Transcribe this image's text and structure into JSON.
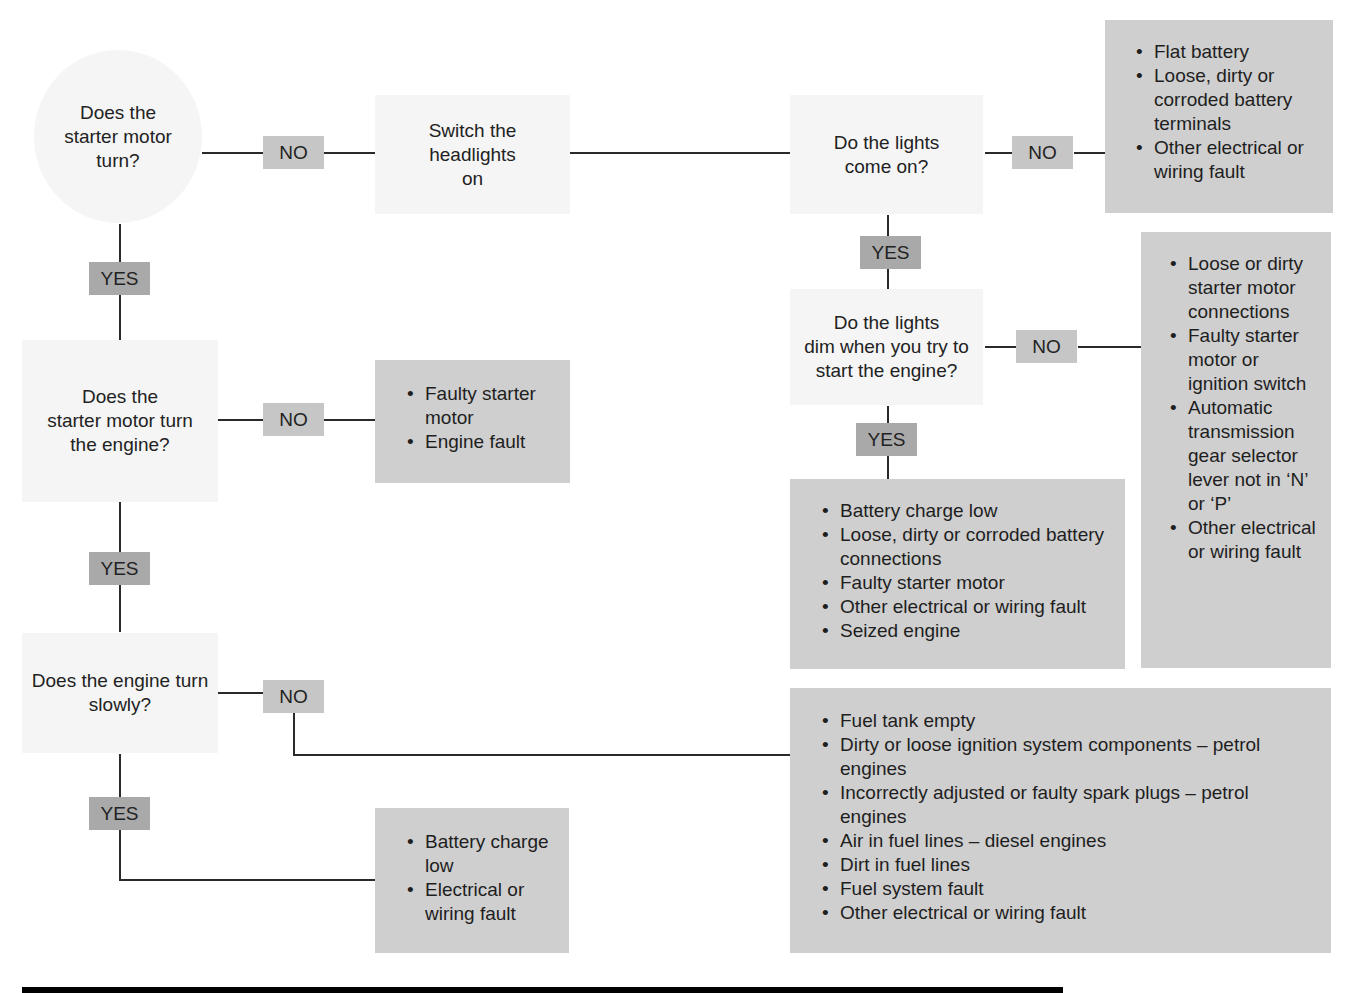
{
  "diagram": {
    "type": "troubleshooting-flowchart",
    "topic": "Engine will not start",
    "colors": {
      "question_bg": "#f5f5f5",
      "answer_bg": "#cfcfcf",
      "no_badge": "#c6c6c6",
      "yes_badge": "#a9a9a9",
      "connector": "#2a2a2a",
      "footer_bar": "#000000"
    },
    "labels": {
      "no": "NO",
      "yes": "YES"
    },
    "questions": {
      "q1": [
        "Does the",
        "starter motor",
        "turn?"
      ],
      "q2": [
        "Does the",
        "starter motor turn",
        "the engine?"
      ],
      "q3": [
        "Does the engine turn",
        "slowly?"
      ],
      "step_headlights": [
        "Switch the",
        "headlights",
        "on"
      ],
      "q4": [
        "Do the lights",
        "come on?"
      ],
      "q5": [
        "Do the lights",
        "dim when you try to",
        "start the engine?"
      ]
    },
    "answers": {
      "lights_off": [
        "Flat battery",
        "Loose, dirty or corroded battery terminals",
        "Other electrical or wiring fault"
      ],
      "lights_no_dim": [
        "Loose or dirty starter motor connections",
        "Faulty starter motor or ignition switch",
        "Automatic transmission gear selector lever not in ‘N’ or ‘P’",
        "Other electrical or wiring fault"
      ],
      "lights_dim": [
        "Battery charge low",
        "Loose, dirty or corroded battery connections",
        "Faulty starter motor",
        "Other electrical or wiring fault",
        "Seized engine"
      ],
      "starter_no_turn_engine": [
        "Faulty starter motor",
        "Engine fault"
      ],
      "engine_not_slow": [
        "Fuel tank empty",
        "Dirty or loose ignition system components – petrol engines",
        "Incorrectly adjusted or faulty spark plugs – petrol engines",
        "Air in fuel lines –  diesel engines",
        "Dirt in fuel lines",
        "Fuel system fault",
        "Other electrical or wiring fault"
      ],
      "engine_slow": [
        "Battery charge low",
        "Electrical or wiring fault"
      ]
    }
  }
}
